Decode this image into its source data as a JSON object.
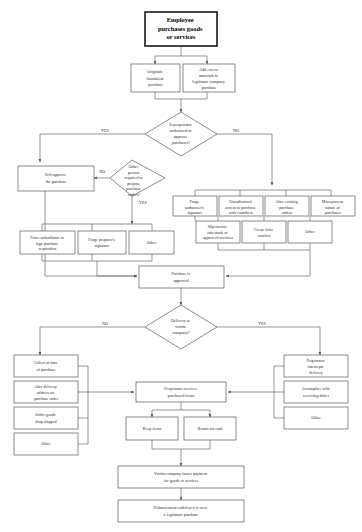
{
  "diagram": {
    "title": "Employee purchases goods or services",
    "type": "fraud-scheme-flowchart",
    "colors": {
      "background": "#ffffff",
      "node_stroke": "#5a5a5a",
      "emphasis_stroke": "#1a1a1a",
      "connector": "#6a6a6a",
      "text": "#2b2b2b"
    },
    "edge_labels": {
      "yes": "YES",
      "no": "NO"
    },
    "nodes": {
      "root": {
        "label": "Employee purchases goods or services",
        "shape": "rect",
        "emphasis": true
      },
      "originate_fraudulent": {
        "label": "Originate fraudulent purchase",
        "shape": "rect"
      },
      "add_excess": {
        "label": "Add excess materials to legitimate company purchase",
        "shape": "rect"
      },
      "authorized_decision": {
        "label": "Is perpetrator authorized to approve purchases?",
        "shape": "diamond"
      },
      "other_person_decision": {
        "label": "Other person required to prepare purchase orders?",
        "shape": "diamond"
      },
      "self_approve": {
        "label": "Self-approve the purchase",
        "shape": "rect"
      },
      "force_subordinate": {
        "label": "Force subordinate to sign purchase requisition",
        "shape": "rect"
      },
      "forge_preparer": {
        "label": "Forge preparer's signature",
        "shape": "rect"
      },
      "other_left": {
        "label": "Other",
        "shape": "rect"
      },
      "forge_authorizer": {
        "label": "Forge authorizer's signature",
        "shape": "rect"
      },
      "unauthorized_access": {
        "label": "Unauthorized access to purchase order numbers",
        "shape": "rect"
      },
      "alter_existing": {
        "label": "Alter existing purchase orders",
        "shape": "rect"
      },
      "misrepresent": {
        "label": "Misrepresent nature of purchases",
        "shape": "rect"
      },
      "slip_invoice": {
        "label": "Slip invoice into stack of approved invoices",
        "shape": "rect"
      },
      "create_voucher": {
        "label": "Create false voucher",
        "shape": "rect"
      },
      "other_right": {
        "label": "Other",
        "shape": "rect"
      },
      "purchase_approved": {
        "label": "Purchase is approved",
        "shape": "rect"
      },
      "delivery_decision": {
        "label": "Delivery to victim company?",
        "shape": "diamond"
      },
      "collect_at_time": {
        "label": "Collect at time of purchase",
        "shape": "rect"
      },
      "alter_delivery": {
        "label": "Alter delivery address on purchase order",
        "shape": "rect"
      },
      "drop_shipped": {
        "label": "Order goods drop shipped",
        "shape": "rect"
      },
      "other_no_branch": {
        "label": "Other",
        "shape": "rect"
      },
      "intercepts_delivery": {
        "label": "Perpetrator intercepts delivery",
        "shape": "rect"
      },
      "accomplice": {
        "label": "Accomplice with receiving duties",
        "shape": "rect"
      },
      "other_yes_branch": {
        "label": "Other",
        "shape": "rect"
      },
      "receives_items": {
        "label": "Perpetrator receives purchased items",
        "shape": "rect"
      },
      "keep_items": {
        "label": "Keep items",
        "shape": "rect"
      },
      "return_for_cash": {
        "label": "Return for cash",
        "shape": "rect"
      },
      "issues_payment": {
        "label": "Victim company issues payment for goods or services",
        "shape": "rect"
      },
      "disbursement_coded": {
        "label": "Disbursement coded as if it were a legitimate purchase",
        "shape": "rect"
      }
    }
  }
}
